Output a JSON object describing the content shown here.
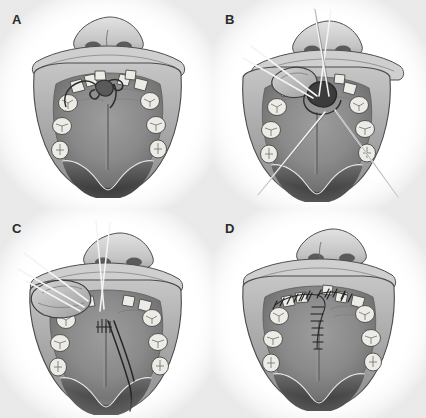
{
  "figure": {
    "style": "grayscale medical line-and-wash illustration",
    "background_color": "#ffffff",
    "layout": {
      "type": "grid",
      "rows": 2,
      "columns": 2,
      "panel_width": 213,
      "panel_height": 209
    },
    "colors": {
      "background": "#ffffff",
      "mucosa_mid": "#8a8a8a",
      "mucosa_light": "#b9b9b9",
      "mucosa_dark": "#5e5e5e",
      "palate_shadow": "#4a4a4a",
      "tooth_fill": "#ededea",
      "tooth_shade": "#c8c6c0",
      "outline": "#3a3a3a",
      "suture_light": "#f2f2f2",
      "suture_dark": "#2a2a2a",
      "label_text": "#2b2b2b",
      "lip_light": "#d6d6d6",
      "nose_light": "#d2d2d2",
      "oral_cavity": "#3d3d3d"
    }
  },
  "panels": [
    {
      "id": "a",
      "label": "A",
      "stage": "Fistula outlined and incision design marked",
      "features": [
        "nose with two nostrils",
        "upper lip",
        "maxillary dental arch",
        "hard palate with median raphe",
        "anterior oronasal fistula",
        "incision outline around fistula",
        "soft palate and uvula"
      ],
      "sutures_visible": false,
      "teeth_count": 12
    },
    {
      "id": "b",
      "label": "B",
      "stage": "Flap elevated and retracted with traction sutures",
      "features": [
        "elevated mucoperiosteal flap",
        "exposed fistula defect",
        "traction sutures at flap margin",
        "two long suture tails crossing the palate",
        "needle holder access line"
      ],
      "sutures_visible": true,
      "suture_count": 6,
      "teeth_count": 12
    },
    {
      "id": "c",
      "label": "C",
      "stage": "Flap rotated medially and nasal layer closed",
      "features": [
        "rotated palatal flap",
        "retraction sutures held laterally",
        "dark suture thread trailing posteriorly",
        "nasal-layer interrupted stitches",
        "donor site visible"
      ],
      "sutures_visible": true,
      "suture_count": 5,
      "teeth_count": 12
    },
    {
      "id": "d",
      "label": "D",
      "stage": "Completed closure with interrupted sutures",
      "features": [
        "closed fistula",
        "interrupted suture line along flap margins",
        "branching Y-shaped suture pattern",
        "intact dental arch",
        "healed palatal contour"
      ],
      "sutures_visible": true,
      "suture_count": 22,
      "teeth_count": 12
    }
  ]
}
